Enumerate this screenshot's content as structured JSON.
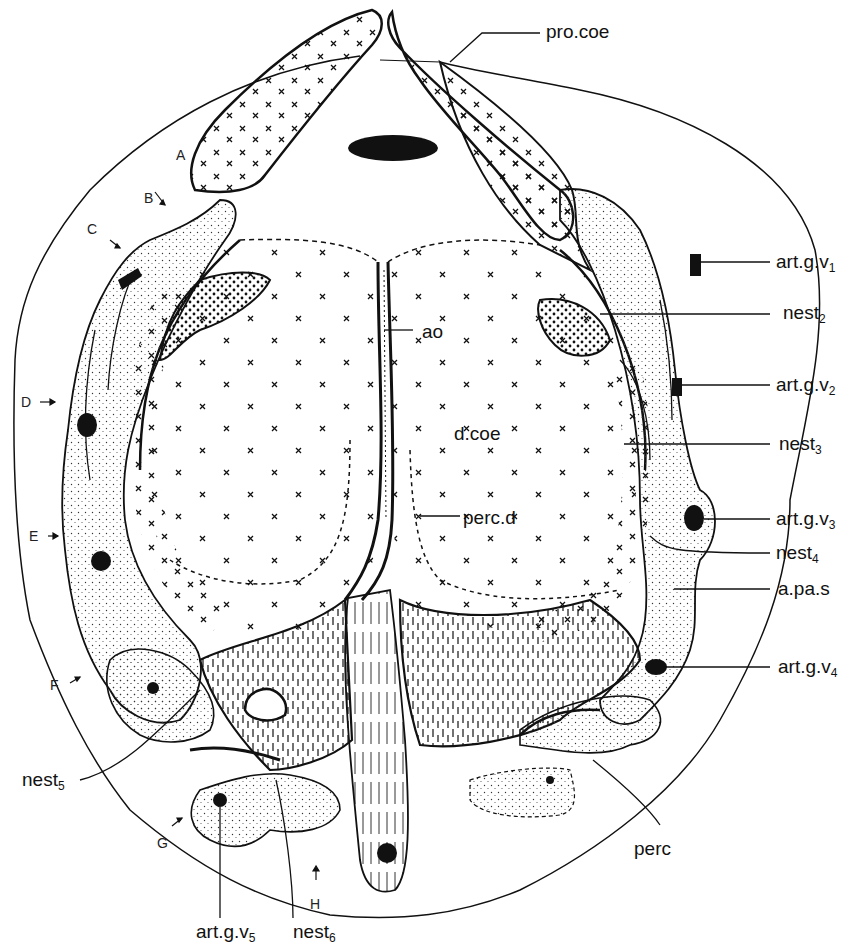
{
  "figure": {
    "type": "anatomical line drawing (cross section)",
    "colors": {
      "ink": "#111111",
      "background": "#ffffff"
    }
  },
  "labels": {
    "pro_coe": {
      "text": "pro.coe"
    },
    "art_g_v1": {
      "text": "art.g.v",
      "sub": "1"
    },
    "nest2": {
      "text": "nest",
      "sub": "2"
    },
    "art_g_v2": {
      "text": "art.g.v",
      "sub": "2"
    },
    "nest3": {
      "text": "nest",
      "sub": "3"
    },
    "art_g_v3": {
      "text": "art.g.v",
      "sub": "3"
    },
    "nest4": {
      "text": "nest",
      "sub": "4"
    },
    "a_pa_s": {
      "text": "a.pa.s"
    },
    "art_g_v4": {
      "text": "art.g.v",
      "sub": "4"
    },
    "perc": {
      "text": "perc"
    },
    "ao": {
      "text": "ao"
    },
    "d_coe": {
      "text": "d.coe"
    },
    "perc_d": {
      "text": "perc.d"
    },
    "nest5": {
      "text": "nest",
      "sub": "5"
    },
    "art_g_v5": {
      "text": "art.g.v",
      "sub": "5"
    },
    "nest6": {
      "text": "nest",
      "sub": "6"
    }
  },
  "section_markers": [
    "A",
    "B",
    "C",
    "D",
    "E",
    "F",
    "G",
    "H"
  ]
}
